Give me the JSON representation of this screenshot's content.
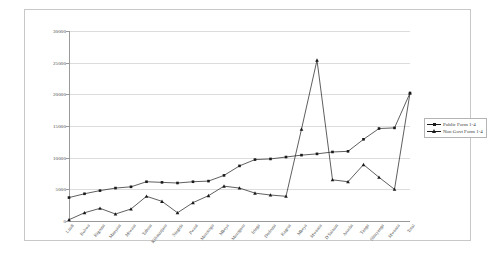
{
  "chart_data": {
    "type": "line",
    "title": "",
    "xlabel": "",
    "ylabel": "",
    "ylim": [
      0,
      30000
    ],
    "yticks": [
      0,
      5000,
      10000,
      15000,
      20000,
      25000,
      30000
    ],
    "grid": true,
    "legend_position": "right",
    "categories": [
      "Lindi",
      "Rukwa",
      "Kigoma",
      "Manyara",
      "Mtwara",
      "Tabora",
      "Kilimanjaro",
      "Singida",
      "Pwani",
      "Mororogo",
      "Mbeya",
      "Morogoro",
      "Iringa",
      "Dodoma",
      "Kagera",
      "Mbeya",
      "Mwanza",
      "D'Salaam",
      "Arusha",
      "Tanga",
      "Shinyanga",
      "Mwanza",
      "Total"
    ],
    "series": [
      {
        "name": "Public Form 1-4",
        "values": [
          3700,
          4300,
          4800,
          5200,
          5400,
          6200,
          6100,
          6000,
          6200,
          6300,
          7200,
          8700,
          9700,
          9800,
          10100,
          10400,
          10600,
          10900,
          11000,
          12900,
          14600,
          14700,
          20200
        ]
      },
      {
        "name": "Non Govt Form 1-4",
        "values": [
          200,
          1300,
          2000,
          1100,
          1900,
          3900,
          3100,
          1300,
          2900,
          4000,
          5500,
          5200,
          4400,
          4100,
          3900,
          14500,
          25400,
          6500,
          6200,
          8900,
          6900,
          5000,
          20200
        ]
      }
    ],
    "legend_entries": [
      "Public Form 1-4",
      "Non Govt Form 1-4"
    ],
    "colors": {
      "line": "#1a1a1a",
      "grid": "#dcdcdc",
      "axis": "#9a9a9a"
    }
  }
}
